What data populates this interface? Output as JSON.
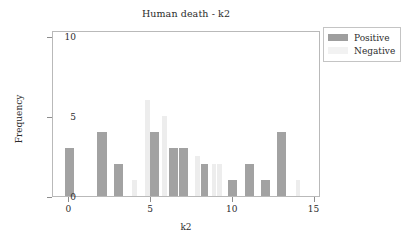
{
  "chart_data": {
    "type": "bar",
    "title": "Human death - k2",
    "xlabel": "k2",
    "ylabel": "Frequency",
    "xlim": [
      -1,
      15.4
    ],
    "ylim": [
      0,
      10.4
    ],
    "xticks": [
      "0",
      "5",
      "10",
      "15"
    ],
    "xtick_values": [
      0,
      5,
      10,
      15
    ],
    "yticks": [
      "0",
      "5",
      "10"
    ],
    "ytick_values": [
      0,
      5,
      10
    ],
    "grid": false,
    "legend_position": "upper right outside",
    "colors": {
      "positive": "#a2a2a2",
      "negative": "#ededed"
    },
    "series": [
      {
        "name": "Positive",
        "color": "#a2a2a2",
        "bars": [
          {
            "x": 0,
            "value": 3,
            "offset": -0.28,
            "width": 0.56
          },
          {
            "x": 2,
            "value": 4,
            "offset": -0.28,
            "width": 0.56
          },
          {
            "x": 3,
            "value": 2,
            "offset": -0.28,
            "width": 0.56
          },
          {
            "x": 5,
            "value": 4,
            "offset": -0.06,
            "width": 0.52
          },
          {
            "x": 6,
            "value": 3,
            "offset": 0.1,
            "width": 0.52
          },
          {
            "x": 7,
            "value": 3,
            "offset": -0.28,
            "width": 0.56
          },
          {
            "x": 8,
            "value": 2,
            "offset": 0.06,
            "width": 0.4
          },
          {
            "x": 10,
            "value": 1,
            "offset": -0.28,
            "width": 0.56
          },
          {
            "x": 11,
            "value": 2,
            "offset": -0.28,
            "width": 0.56
          },
          {
            "x": 12,
            "value": 1,
            "offset": -0.28,
            "width": 0.56
          },
          {
            "x": 13,
            "value": 4,
            "offset": -0.28,
            "width": 0.56
          }
        ]
      },
      {
        "name": "Negative",
        "color": "#ededed",
        "bars": [
          {
            "x": 4,
            "value": 1,
            "offset": -0.16,
            "width": 0.3
          },
          {
            "x": 5,
            "value": 6,
            "offset": -0.4,
            "width": 0.34
          },
          {
            "x": 6,
            "value": 5,
            "offset": -0.36,
            "width": 0.34
          },
          {
            "x": 8,
            "value": 2.5,
            "offset": -0.34,
            "width": 0.34
          },
          {
            "x": 9,
            "value": 2,
            "offset": -0.3,
            "width": 0.26
          },
          {
            "x": 9,
            "value": 2,
            "offset": 0.06,
            "width": 0.26
          },
          {
            "x": 14,
            "value": 1,
            "offset": -0.16,
            "width": 0.3
          }
        ]
      }
    ]
  },
  "legend": {
    "items": [
      {
        "label": "Positive",
        "swatch": "positive-swatch"
      },
      {
        "label": "Negative",
        "swatch": "negative-swatch"
      }
    ]
  }
}
